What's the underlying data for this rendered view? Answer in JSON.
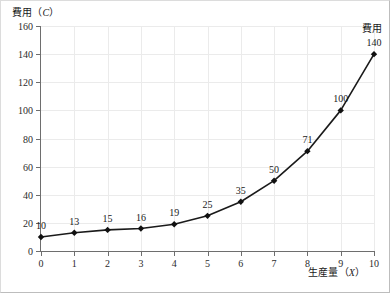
{
  "chart_data": {
    "type": "line",
    "title": "",
    "xlabel": "生産量（X）",
    "ylabel": "費用（C）",
    "xlabel_text": "生産量",
    "xlabel_symbol": "X",
    "ylabel_text": "費用",
    "ylabel_symbol": "C",
    "x": [
      0,
      1,
      2,
      3,
      4,
      5,
      6,
      7,
      8,
      9,
      10
    ],
    "values": [
      10,
      13,
      15,
      16,
      19,
      25,
      35,
      50,
      71,
      100,
      140
    ],
    "point_labels": [
      "10",
      "13",
      "15",
      "16",
      "19",
      "25",
      "35",
      "50",
      "71",
      "100",
      "140"
    ],
    "series": [
      {
        "name": "費用",
        "values": [
          10,
          13,
          15,
          16,
          19,
          25,
          35,
          50,
          71,
          100,
          140
        ]
      }
    ],
    "annotation": "費用",
    "xtick_labels": [
      "0",
      "1",
      "2",
      "3",
      "4",
      "5",
      "6",
      "7",
      "8",
      "9",
      "10"
    ],
    "ytick_labels": [
      "0",
      "20",
      "40",
      "60",
      "80",
      "100",
      "120",
      "140",
      "160"
    ],
    "yticks": [
      0,
      20,
      40,
      60,
      80,
      100,
      120,
      140,
      160
    ],
    "xlim": [
      0,
      10
    ],
    "ylim": [
      0,
      160
    ],
    "grid": true,
    "legend_position": "none",
    "marker": "diamond",
    "colors": {
      "line": "#1a1a1a",
      "marker": "#111111",
      "grid": "#ebebeb",
      "axis": "#6e6e6e",
      "background": "#ffffff",
      "text": "#1a1a1a"
    }
  }
}
